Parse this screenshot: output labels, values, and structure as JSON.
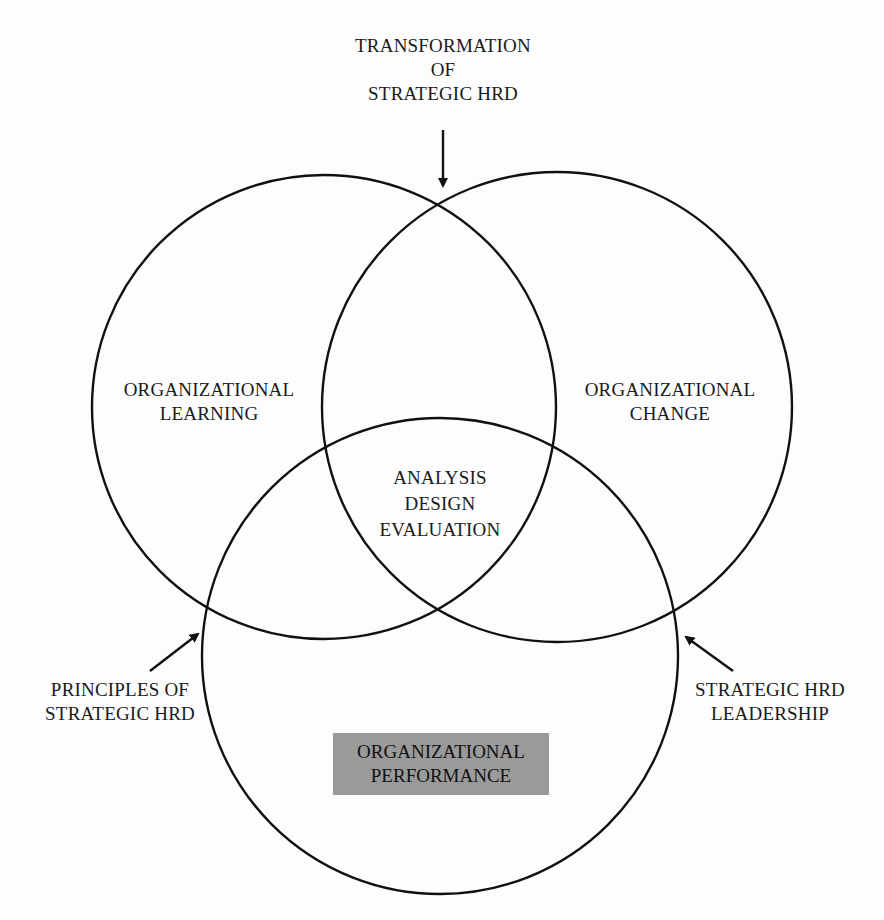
{
  "diagram": {
    "type": "venn",
    "circles": [
      {
        "id": "learning",
        "label_lines": [
          "ORGANIZATIONAL",
          "LEARNING"
        ],
        "cx": 324,
        "cy": 407,
        "r": 232
      },
      {
        "id": "change",
        "label_lines": [
          "ORGANIZATIONAL",
          "CHANGE"
        ],
        "cx": 557,
        "cy": 407,
        "r": 235
      },
      {
        "id": "performance",
        "label_lines": [
          "ORGANIZATIONAL",
          "PERFORMANCE"
        ],
        "cx": 440,
        "cy": 656,
        "r": 238,
        "highlighted": true,
        "highlight_color": "#9a9a9a"
      }
    ],
    "center_label": {
      "lines": [
        "ANALYSIS",
        "DESIGN",
        "EVALUATION"
      ]
    },
    "external_labels": [
      {
        "id": "transformation",
        "lines": [
          "TRANSFORMATION",
          "OF",
          "STRATEGIC HRD"
        ],
        "arrow_points_to": "top intersection of learning and change circles"
      },
      {
        "id": "principles",
        "lines": [
          "PRINCIPLES OF",
          "STRATEGIC HRD"
        ],
        "arrow_points_to": "intersection of learning and performance circles"
      },
      {
        "id": "leadership",
        "lines": [
          "STRATEGIC HRD",
          "LEADERSHIP"
        ],
        "arrow_points_to": "intersection of change and performance circles"
      }
    ],
    "stroke_color": "#111111"
  }
}
